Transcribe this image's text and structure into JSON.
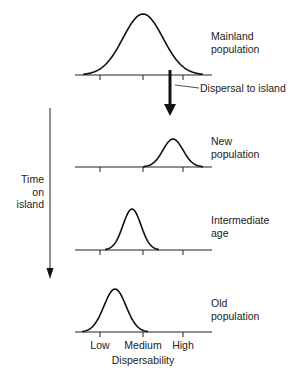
{
  "diagram": {
    "panels": [
      {
        "id": "mainland",
        "label_line1": "Mainland",
        "label_line2": "population",
        "peak_position": "medium",
        "baseline_y": 75,
        "center_x": 143,
        "peak_y": 14,
        "sigma": 20
      },
      {
        "id": "new",
        "label_line1": "New",
        "label_line2": "population",
        "peak_position": "medium-high",
        "baseline_y": 167,
        "center_x": 173,
        "peak_y": 139,
        "sigma": 10
      },
      {
        "id": "intermediate",
        "label_line1": "Intermediate",
        "label_line2": "age",
        "peak_position": "low-medium",
        "baseline_y": 250,
        "center_x": 132,
        "peak_y": 209,
        "sigma": 9
      },
      {
        "id": "old",
        "label_line1": "Old",
        "label_line2": "population",
        "peak_position": "low",
        "baseline_y": 332,
        "center_x": 115,
        "peak_y": 289,
        "sigma": 11
      }
    ],
    "dispersal_label": "Dispersal to island",
    "time_label_line1": "Time",
    "time_label_line2": "on",
    "time_label_line3": "island",
    "axis": {
      "ticks": [
        "Low",
        "Medium",
        "High"
      ],
      "title": "Dispersability"
    },
    "colors": {
      "line": "#111111",
      "text": "#222222",
      "background": "#ffffff"
    }
  }
}
